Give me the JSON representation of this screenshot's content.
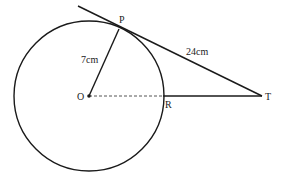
{
  "diagram": {
    "type": "geometry",
    "colors": {
      "stroke": "#1a1a1a",
      "dashed": "#555555",
      "text": "#222222",
      "background": "#ffffff"
    },
    "circle": {
      "cx": 89,
      "cy": 96,
      "r": 75
    },
    "points": {
      "O": {
        "label": "O",
        "x": 89,
        "y": 96
      },
      "P": {
        "label": "P",
        "x": 119,
        "y": 29
      },
      "R": {
        "label": "R",
        "x": 163,
        "y": 96
      },
      "T": {
        "label": "T",
        "x": 262,
        "y": 96
      }
    },
    "segments": {
      "OP": {
        "label": "7cm",
        "style": "solid"
      },
      "PT": {
        "label": "24cm",
        "style": "solid"
      },
      "OR": {
        "label": "",
        "style": "dashed"
      },
      "RT": {
        "label": "",
        "style": "solid"
      }
    },
    "tangent_start": {
      "x": 78,
      "y": 6
    }
  }
}
